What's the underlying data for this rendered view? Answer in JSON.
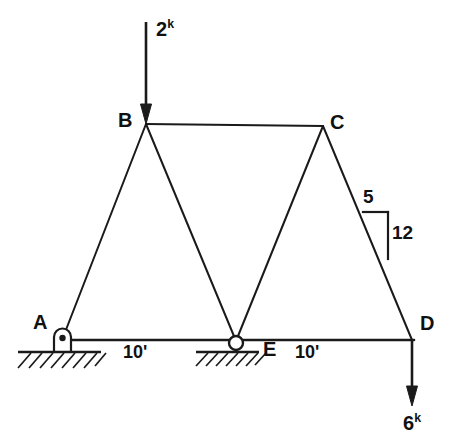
{
  "figure": {
    "type": "structural-truss-diagram",
    "background_color": "#ffffff",
    "line_color": "#1a1a1a"
  },
  "joints": [
    {
      "id": "A",
      "label": "A",
      "x": 62,
      "y": 340,
      "support": "pin"
    },
    {
      "id": "B",
      "label": "B",
      "x": 146,
      "y": 124,
      "support": "none"
    },
    {
      "id": "C",
      "label": "C",
      "x": 323,
      "y": 126,
      "support": "none"
    },
    {
      "id": "D",
      "label": "D",
      "x": 412,
      "y": 340,
      "support": "none"
    },
    {
      "id": "E",
      "label": "E",
      "x": 236,
      "y": 341,
      "support": "roller"
    }
  ],
  "members": [
    {
      "from": "A",
      "to": "B"
    },
    {
      "from": "B",
      "to": "C"
    },
    {
      "from": "C",
      "to": "D"
    },
    {
      "from": "A",
      "to": "E"
    },
    {
      "from": "E",
      "to": "D"
    },
    {
      "from": "B",
      "to": "E"
    },
    {
      "from": "E",
      "to": "C"
    }
  ],
  "loads": [
    {
      "id": "load-at-B",
      "magnitude": "2",
      "unit": "k",
      "direction": "down",
      "applied_at": "B",
      "label_x": 157,
      "label_y": 22
    },
    {
      "id": "load-at-D",
      "magnitude": "6",
      "unit": "k",
      "direction": "down",
      "applied_at": "D",
      "label_x": 404,
      "label_y": 418
    }
  ],
  "dimensions": [
    {
      "id": "dim-A-E",
      "text": "10'",
      "x": 126,
      "y": 345
    },
    {
      "id": "dim-E-D",
      "text": "10'",
      "x": 297,
      "y": 345
    }
  ],
  "slope_indicator": {
    "id": "slope-CD",
    "run_label": "5",
    "rise_label": "12",
    "run_x": 364,
    "run_y": 190,
    "rise_x": 392,
    "rise_y": 226
  },
  "ground": [
    {
      "id": "ground-at-A",
      "x1": 18,
      "x2": 100,
      "y": 352
    },
    {
      "id": "ground-at-E",
      "x1": 197,
      "x2": 259,
      "y": 352
    }
  ],
  "joint_labels": {
    "A": {
      "x": 33,
      "y": 327
    },
    "B": {
      "x": 118,
      "y": 112
    },
    "C": {
      "x": 330,
      "y": 113
    },
    "D": {
      "x": 420,
      "y": 328
    },
    "E": {
      "x": 264,
      "y": 345
    }
  }
}
